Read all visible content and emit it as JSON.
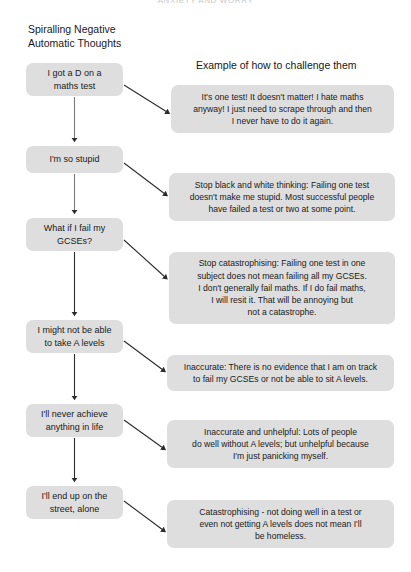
{
  "page": {
    "top_title": "ANXIETY AND WORRY",
    "background_color": "#ffffff",
    "box_color": "#dedede",
    "arrow_color": "#2b2b2b",
    "width": 411,
    "height": 572
  },
  "headings": {
    "left": "Spiralling Negative\nAutomatic Thoughts",
    "right": "Example of how to challenge them"
  },
  "thoughts": [
    {
      "label": "I got a D on a\nmaths test",
      "x": 26,
      "y": 63,
      "w": 97,
      "h": 33
    },
    {
      "label": "I'm so stupid",
      "x": 26,
      "y": 146,
      "w": 97,
      "h": 27
    },
    {
      "label": "What if I fail my\nGCSEs?",
      "x": 26,
      "y": 218,
      "w": 97,
      "h": 33
    },
    {
      "label": "I might not be able\nto take A levels",
      "x": 26,
      "y": 320,
      "w": 97,
      "h": 33
    },
    {
      "label": "I'll never achieve\nanything in life",
      "x": 26,
      "y": 404,
      "w": 97,
      "h": 33
    },
    {
      "label": "I'll end up on the\nstreet, alone",
      "x": 26,
      "y": 486,
      "w": 97,
      "h": 33
    }
  ],
  "challenges": [
    {
      "label": "It's one test! It doesn't matter! I hate maths\nanyway! I just need to scrape through and then\nI never have to do it again.",
      "x": 171,
      "y": 85,
      "w": 223,
      "h": 48
    },
    {
      "label": "Stop black and white thinking: Failing one test\ndoesn't make me stupid. Most successful people\nhave failed a test or two at some point.",
      "x": 169,
      "y": 173,
      "w": 226,
      "h": 48
    },
    {
      "label": "Stop catastrophising: Failing one test in one\nsubject does not mean failing all my GCSEs.\nI don't generally fail maths. If I do fail maths,\nI will resit it. That will be annoying but\nnot a catastrophe.",
      "x": 169,
      "y": 252,
      "w": 226,
      "h": 72
    },
    {
      "label": "Inaccurate: There is no evidence that I am on track\nto fail my GCSEs or not be able to sit A levels.",
      "x": 167,
      "y": 355,
      "w": 227,
      "h": 36
    },
    {
      "label": "Inaccurate and unhelpful: Lots of people\ndo well without A levels; but unhelpful because\nI'm just panicking myself.",
      "x": 167,
      "y": 420,
      "w": 227,
      "h": 48
    },
    {
      "label": "Catastrophising - not doing well in a test or\neven not getting A levels does not mean I'll\nbe homeless.",
      "x": 167,
      "y": 500,
      "w": 227,
      "h": 48
    }
  ]
}
